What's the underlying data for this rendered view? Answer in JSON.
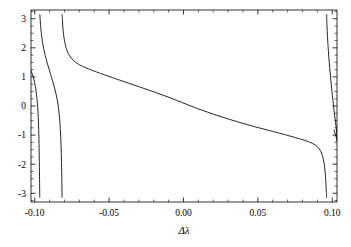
{
  "chart_data": {
    "type": "line",
    "title": "",
    "subtitle": "",
    "xlabel": "Δλ",
    "ylabel": "",
    "xlim": [
      -0.1025,
      0.1032
    ],
    "ylim": [
      -3.3,
      3.3
    ],
    "grid": false,
    "legend": null,
    "background": "#ffffff",
    "line_color": "#000000",
    "frame_color": "#000000",
    "xticks": [
      -0.1,
      -0.05,
      0.0,
      0.05,
      0.1
    ],
    "xtick_labels": [
      "-0.10",
      "-0.05",
      "0.00",
      "0.05",
      "0.10"
    ],
    "yticks": [
      -3,
      -2,
      -1,
      0,
      1,
      2,
      3
    ],
    "ytick_labels": [
      "-3",
      "-2",
      "-1",
      "0",
      "1",
      "2",
      "3"
    ],
    "x_minor_ticks_per_interval": 5,
    "y_minor_ticks_per_interval": 4,
    "tick_direction": "in",
    "frame_sides": [
      "left",
      "bottom",
      "right",
      "top"
    ],
    "asymptotes": [
      -0.0966,
      -0.0816,
      0.0962
    ],
    "series": [
      {
        "name": "branch-1",
        "comment": "enters left edge near y=1.2, falls steeply to -pi at first asymptote",
        "x": [
          -0.1025,
          -0.1018,
          -0.101,
          -0.1,
          -0.0992,
          -0.0986,
          -0.098,
          -0.0976,
          -0.0973,
          -0.0971,
          -0.0969,
          -0.09675,
          -0.09665,
          -0.0966
        ],
        "y": [
          1.21,
          1.12,
          1.0,
          0.8,
          0.55,
          0.3,
          -0.05,
          -0.4,
          -0.85,
          -1.3,
          -1.95,
          -2.55,
          -2.95,
          -3.14
        ]
      },
      {
        "name": "branch-2",
        "comment": "re-enters at +pi after first asymptote, descends to -pi at second asymptote",
        "x": [
          -0.09655,
          -0.0964,
          -0.0961,
          -0.0956,
          -0.0949,
          -0.094,
          -0.0929,
          -0.0916,
          -0.0902,
          -0.0888,
          -0.0872,
          -0.0858,
          -0.0845,
          -0.0835,
          -0.0828,
          -0.0823,
          -0.082,
          -0.08175,
          -0.08165,
          -0.0816
        ],
        "y": [
          3.14,
          3.02,
          2.8,
          2.52,
          2.24,
          1.98,
          1.73,
          1.48,
          1.24,
          1.0,
          0.72,
          0.44,
          0.1,
          -0.3,
          -0.78,
          -1.35,
          -1.95,
          -2.6,
          -2.98,
          -3.14
        ]
      },
      {
        "name": "branch-3-main",
        "comment": "main central branch from +pi down to -pi across the plot",
        "x": [
          -0.08155,
          -0.0814,
          -0.0811,
          -0.0806,
          -0.0799,
          -0.079,
          -0.0779,
          -0.0766,
          -0.075,
          -0.0732,
          -0.071,
          -0.0685,
          -0.0655,
          -0.062,
          -0.058,
          -0.053,
          -0.047,
          -0.04,
          -0.032,
          -0.023,
          -0.013,
          -0.002,
          0.009,
          0.02,
          0.031,
          0.0415,
          0.0515,
          0.0605,
          0.0685,
          0.0755,
          0.0815,
          0.0865,
          0.09,
          0.0925,
          0.0941,
          0.0951,
          0.0957,
          0.096,
          0.09615,
          0.0962
        ],
        "y": [
          3.14,
          2.98,
          2.72,
          2.45,
          2.22,
          2.02,
          1.86,
          1.73,
          1.62,
          1.53,
          1.45,
          1.38,
          1.31,
          1.24,
          1.16,
          1.07,
          0.96,
          0.84,
          0.7,
          0.54,
          0.36,
          0.14,
          -0.08,
          -0.28,
          -0.46,
          -0.62,
          -0.76,
          -0.88,
          -0.99,
          -1.09,
          -1.18,
          -1.28,
          -1.4,
          -1.58,
          -1.85,
          -2.2,
          -2.62,
          -2.92,
          -3.08,
          -3.14
        ]
      },
      {
        "name": "branch-4",
        "comment": "final branch re-entering at +pi, descending to about -1.2 at right edge",
        "x": [
          0.09625,
          0.0963,
          0.0965,
          0.0968,
          0.0972,
          0.0977,
          0.0983,
          0.099,
          0.0997,
          0.1005,
          0.1012,
          0.102,
          0.1026,
          0.103,
          0.1032
        ],
        "y": [
          3.14,
          3.0,
          2.72,
          2.4,
          2.05,
          1.68,
          1.3,
          0.92,
          0.55,
          0.18,
          -0.15,
          -0.48,
          -0.72,
          -0.95,
          -1.18
        ]
      },
      {
        "name": "branch-4b",
        "comment": "short continuation segment at far right below the main descent",
        "x": [
          0.1012,
          0.1018,
          0.1024,
          0.1029,
          0.1032
        ],
        "y": [
          -0.82,
          -0.92,
          -1.02,
          -1.12,
          -1.2
        ]
      }
    ]
  }
}
